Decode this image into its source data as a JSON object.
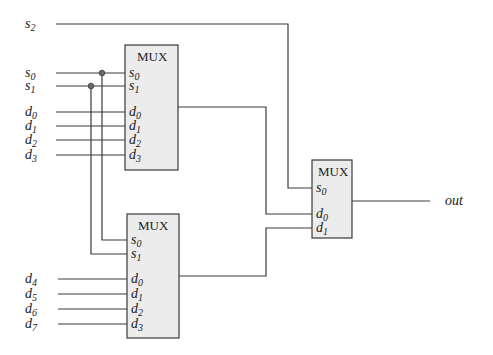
{
  "diagram": {
    "type": "8-to-1 multiplexer built from 4-to-1 and 2-to-1 multiplexers",
    "inputs": {
      "s2": {
        "base": "s",
        "sub": "2"
      },
      "s0": {
        "base": "s",
        "sub": "0"
      },
      "s1": {
        "base": "s",
        "sub": "1"
      },
      "d0": {
        "base": "d",
        "sub": "0"
      },
      "d1": {
        "base": "d",
        "sub": "1"
      },
      "d2": {
        "base": "d",
        "sub": "2"
      },
      "d3": {
        "base": "d",
        "sub": "3"
      },
      "d4": {
        "base": "d",
        "sub": "4"
      },
      "d5": {
        "base": "d",
        "sub": "5"
      },
      "d6": {
        "base": "d",
        "sub": "6"
      },
      "d7": {
        "base": "d",
        "sub": "7"
      }
    },
    "mux_top": {
      "title": "MUX",
      "ports": [
        {
          "base": "s",
          "sub": "0"
        },
        {
          "base": "s",
          "sub": "1"
        },
        {
          "base": "d",
          "sub": "0"
        },
        {
          "base": "d",
          "sub": "1"
        },
        {
          "base": "d",
          "sub": "2"
        },
        {
          "base": "d",
          "sub": "3"
        }
      ]
    },
    "mux_bottom": {
      "title": "MUX",
      "ports": [
        {
          "base": "s",
          "sub": "0"
        },
        {
          "base": "s",
          "sub": "1"
        },
        {
          "base": "d",
          "sub": "0"
        },
        {
          "base": "d",
          "sub": "1"
        },
        {
          "base": "d",
          "sub": "2"
        },
        {
          "base": "d",
          "sub": "3"
        }
      ]
    },
    "mux_final": {
      "title": "MUX",
      "ports": [
        {
          "base": "s",
          "sub": "0"
        },
        {
          "base": "d",
          "sub": "0"
        },
        {
          "base": "d",
          "sub": "1"
        }
      ]
    },
    "output": {
      "label": "out"
    },
    "colors": {
      "wire": "#3a3a3a",
      "box_fill": "#ececec",
      "junction": "#6a6a6a"
    }
  }
}
